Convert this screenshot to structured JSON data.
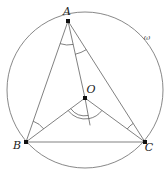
{
  "figure": {
    "background_color": "#ffffff",
    "stroke_color": "#4a4a4a",
    "circle_color": "#6a6a6a",
    "label_color": "#1a1a1a"
  },
  "labels": {
    "vertex_a": "A",
    "vertex_b": "B",
    "vertex_c": "C",
    "center_o": "O",
    "circle_omega": "ω"
  },
  "geometry": {
    "circle": {
      "cx": 85,
      "cy": 90,
      "r": 78
    },
    "points": {
      "A": {
        "x": 68,
        "y": 21,
        "label_dx": -1,
        "label_dy": -6
      },
      "B": {
        "x": 26,
        "y": 142,
        "label_dx": -9,
        "label_dy": 7
      },
      "C": {
        "x": 145,
        "y": 142,
        "label_dx": 4,
        "label_dy": 9
      },
      "O": {
        "x": 85,
        "y": 98,
        "label_dx": 6,
        "label_dy": -5
      }
    },
    "omega_label": {
      "x": 147,
      "y": 40
    },
    "bisector_end": {
      "x": 90,
      "y": 125
    },
    "segments": [
      {
        "name": "side-AB",
        "from": "A",
        "to": "B"
      },
      {
        "name": "side-BC",
        "from": "B",
        "to": "C"
      },
      {
        "name": "side-CA",
        "from": "C",
        "to": "A"
      },
      {
        "name": "radius-OA",
        "from": "O",
        "to": "A"
      },
      {
        "name": "radius-OB",
        "from": "O",
        "to": "B"
      },
      {
        "name": "radius-OC",
        "from": "O",
        "to": "C"
      }
    ],
    "angle_marks": [
      {
        "name": "angle-BAO",
        "vertex": "A",
        "radius": 24,
        "arcs": 1
      },
      {
        "name": "angle-OAC",
        "vertex": "A",
        "radius": 34,
        "arcs": 1
      },
      {
        "name": "angle-ABO",
        "vertex": "B",
        "radius": 22,
        "arcs": 1
      },
      {
        "name": "angle-OCA",
        "vertex": "C",
        "radius": 22,
        "arcs": 1
      },
      {
        "name": "angle-BOD",
        "vertex": "O",
        "radius": 21,
        "arcs": 2
      },
      {
        "name": "angle-DOC",
        "vertex": "O",
        "radius": 21,
        "arcs": 1
      }
    ]
  }
}
